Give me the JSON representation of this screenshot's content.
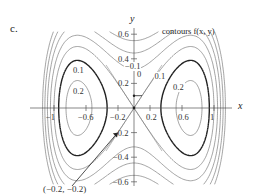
{
  "panel_label": "c.",
  "chart_data": {
    "type": "contour",
    "title": "contours f(x, y)",
    "xlabel": "x",
    "ylabel": "y",
    "xlim": [
      -1.1,
      1.1
    ],
    "ylim": [
      -0.65,
      0.65
    ],
    "x_ticks": [
      -1,
      -0.6,
      -0.2,
      0.2,
      0.6,
      1
    ],
    "x_tick_labels": [
      "−1",
      "−0.6",
      "−0.2",
      "0.2",
      "0.6",
      "1"
    ],
    "y_ticks": [
      0.6,
      0.4,
      0.2,
      -0.2,
      -0.4,
      -0.6
    ],
    "y_tick_labels": [
      "0.6",
      "0.4",
      "0.2",
      "−0.2",
      "−0.4",
      "−0.6"
    ],
    "contour_levels": [
      -0.4,
      -0.3,
      -0.2,
      -0.1,
      0,
      0.1,
      0.2
    ],
    "highlighted_level": 0.1,
    "contour_labels": [
      {
        "text": "0.1",
        "x": -0.7,
        "y": 0.3
      },
      {
        "text": "0.2",
        "x": -0.7,
        "y": 0.13
      },
      {
        "text": "−0.1",
        "x": -0.05,
        "y": 0.33
      },
      {
        "text": "0",
        "x": 0.1,
        "y": 0.27
      },
      {
        "text": "0.1",
        "x": 0.32,
        "y": 0.25
      },
      {
        "text": "0.2",
        "x": 0.55,
        "y": 0.16
      }
    ],
    "critical_point": {
      "x": 0,
      "y": 0,
      "type": "saddle"
    },
    "annotation": {
      "text": "(−0.2, −0.2)",
      "point": [
        -0.2,
        -0.2
      ]
    },
    "gradient_arrow": {
      "from": [
        0,
        0.1
      ],
      "to": [
        0.1,
        0.1
      ]
    },
    "grid": false,
    "legend": null
  },
  "labels": {
    "title": "contours f(x, y)",
    "x_axis": "x",
    "y_axis": "y",
    "point_annotation": "(−0.2, −0.2)"
  }
}
